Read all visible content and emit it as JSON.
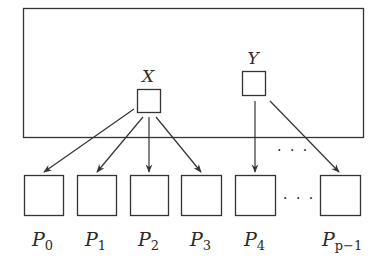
{
  "diagram": {
    "container": {
      "label": ""
    },
    "sources": [
      {
        "id": "X",
        "label": "X"
      },
      {
        "id": "Y",
        "label": "Y"
      }
    ],
    "processors": [
      {
        "id": "P0",
        "base": "P",
        "sub": "0"
      },
      {
        "id": "P1",
        "base": "P",
        "sub": "1"
      },
      {
        "id": "P2",
        "base": "P",
        "sub": "2"
      },
      {
        "id": "P3",
        "base": "P",
        "sub": "3"
      },
      {
        "id": "P4",
        "base": "P",
        "sub": "4"
      },
      {
        "id": "Pp-1",
        "base": "P",
        "sub": "p−1"
      }
    ],
    "ellipsis": "· · ·",
    "edges": [
      {
        "from": "X",
        "to": "P0"
      },
      {
        "from": "X",
        "to": "P1"
      },
      {
        "from": "X",
        "to": "P2"
      },
      {
        "from": "X",
        "to": "P3"
      },
      {
        "from": "Y",
        "to": "P4"
      },
      {
        "from": "Y",
        "to": "Pp-1"
      }
    ],
    "colors": {
      "stroke": "#333333",
      "background": "#ffffff"
    }
  }
}
